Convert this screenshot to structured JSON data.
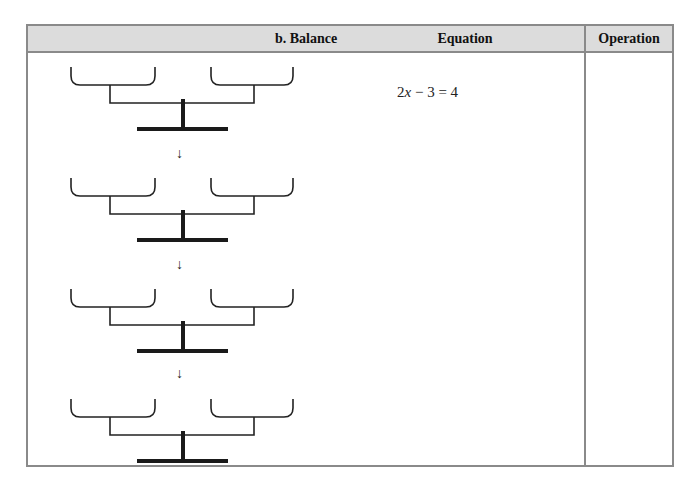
{
  "table": {
    "headers": [
      {
        "label": "b.  Balance"
      },
      {
        "label": "Equation"
      },
      {
        "label": "Operation"
      }
    ],
    "rows": [
      {
        "equation_parts": {
          "coef": "2",
          "var": "x",
          "rest": " − 3 = 4"
        },
        "operation": ""
      },
      {
        "equation_parts": null,
        "operation": ""
      },
      {
        "equation_parts": null,
        "operation": ""
      },
      {
        "equation_parts": null,
        "operation": ""
      }
    ],
    "arrow_glyph": "↓",
    "balance_count": 4
  },
  "colors": {
    "header_bg": "#dcdcdc",
    "border": "#8a8a8a",
    "ink": "#222222"
  }
}
